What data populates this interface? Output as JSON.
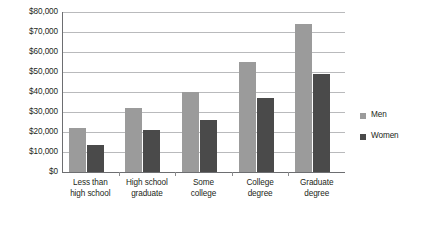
{
  "chart_data": {
    "type": "bar",
    "title": "",
    "xlabel": "",
    "ylabel": "",
    "categories": [
      "Less than\nhigh school",
      "High school\ngraduate",
      "Some\ncollege",
      "College\ndegree",
      "Graduate\ndegree"
    ],
    "series": [
      {
        "name": "Men",
        "color": "#9b9b9b",
        "values": [
          22000,
          32000,
          40000,
          55000,
          74000
        ]
      },
      {
        "name": "Women",
        "color": "#4a4a4a",
        "values": [
          13500,
          21000,
          26000,
          37000,
          49000
        ]
      }
    ],
    "ylim": [
      0,
      80000
    ],
    "ytick_values": [
      0,
      10000,
      20000,
      30000,
      40000,
      50000,
      60000,
      70000,
      80000
    ],
    "ytick_labels": [
      "$0",
      "$10,000",
      "$20,000",
      "$30,000",
      "$40,000",
      "$50,000",
      "$60,000",
      "$70,000",
      "$80,000"
    ],
    "grid": true,
    "legend_position": "right",
    "legend_entries": [
      "Men",
      "Women"
    ]
  }
}
